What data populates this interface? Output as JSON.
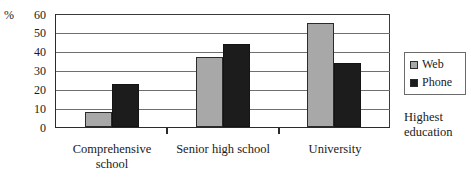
{
  "chart_data": {
    "type": "bar",
    "title": "",
    "subtitle": "",
    "categories": [
      "Comprehensive school",
      "Senior high school",
      "University"
    ],
    "series": [
      {
        "name": "Web",
        "values": [
          8,
          37,
          55
        ],
        "color": "#a8a8a8"
      },
      {
        "name": "Phone",
        "values": [
          23,
          44,
          34
        ],
        "color": "#1c1c1c"
      }
    ],
    "xlabel": "Highest education",
    "ylabel": "%",
    "ylim": [
      0,
      60
    ],
    "yticks": [
      0,
      10,
      20,
      30,
      40,
      50,
      60
    ],
    "grid": true,
    "legend_position": "right"
  },
  "axis": {
    "unit_label": "%",
    "tick_labels": [
      "60",
      "50",
      "40",
      "30",
      "20",
      "10",
      "0"
    ],
    "x_title_line1": "Highest",
    "x_title_line2": "education"
  },
  "categories": [
    {
      "line1": "Comprehensive",
      "line2": "school"
    },
    {
      "line1": "Senior high school",
      "line2": ""
    },
    {
      "line1": "University",
      "line2": ""
    }
  ],
  "legend": {
    "items": [
      {
        "label": "Web",
        "color": "#a8a8a8"
      },
      {
        "label": "Phone",
        "color": "#1c1c1c"
      }
    ]
  }
}
